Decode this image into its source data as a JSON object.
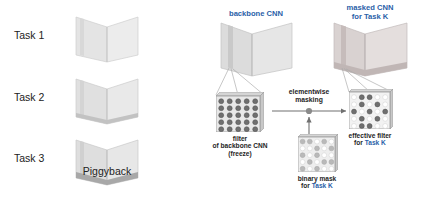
{
  "figure": {
    "method_name": "Piggyback",
    "left_panel": {
      "task_labels": [
        "Task 1",
        "Task 2",
        "Task 3"
      ],
      "caption": "Piggyback",
      "net_icon_name": "task-network-shape"
    },
    "right_panel": {
      "backbone_title": "backbone CNN",
      "masked_title_line1": "masked CNN",
      "masked_title_line2_prefix": "for ",
      "masked_title_line2_task": "Task K",
      "operation_label_line1": "elementwise",
      "operation_label_line2": "masking",
      "filter_caption_line1": "filter",
      "filter_caption_line2": "of backbone CNN",
      "filter_caption_line3": "(freeze)",
      "mask_caption_line1": "binary mask",
      "mask_caption_line2_prefix": "for ",
      "mask_caption_line2_task": "Task K",
      "effective_caption_line1": "effective filter",
      "effective_caption_line2_prefix": "for ",
      "effective_caption_line2_task": "Task K"
    },
    "grids": {
      "size": 5,
      "backbone_filter": [
        [
          1,
          1,
          1,
          1,
          1
        ],
        [
          1,
          1,
          1,
          1,
          1
        ],
        [
          1,
          1,
          1,
          1,
          1
        ],
        [
          1,
          1,
          1,
          1,
          1
        ],
        [
          1,
          1,
          1,
          1,
          1
        ]
      ],
      "binary_mask": [
        [
          1,
          1,
          0,
          1,
          0
        ],
        [
          0,
          0,
          1,
          0,
          1
        ],
        [
          1,
          0,
          1,
          0,
          0
        ],
        [
          0,
          1,
          0,
          1,
          1
        ],
        [
          1,
          0,
          1,
          0,
          0
        ]
      ],
      "effective_filter": [
        [
          0,
          1,
          1,
          0,
          0
        ],
        [
          0,
          1,
          0,
          1,
          0
        ],
        [
          1,
          0,
          1,
          0,
          1
        ],
        [
          0,
          1,
          0,
          1,
          0
        ],
        [
          0,
          1,
          1,
          0,
          0
        ]
      ]
    },
    "colors": {
      "accent_blue": "#2b5fa8",
      "text_dark": "#1e1e1e",
      "filter_dot": "#6f6f6f",
      "mask_dot_on": "#b9b9b9",
      "mask_dot_off": "#ffffff",
      "grid_fill": "#e8e8e8",
      "grid_stroke": "#9a9a9a",
      "net_face_light": "#e4e4e4",
      "net_face_mid": "#d2d2d2",
      "net_face_dark": "#b6b6b6",
      "net_masked_tint": "#ddd4d2",
      "connector": "#a9a9a9",
      "arrow": "#707070"
    }
  }
}
